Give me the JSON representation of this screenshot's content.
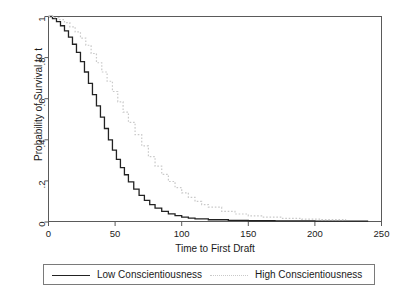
{
  "chart_data": {
    "type": "line",
    "title": "",
    "subtitle": "",
    "xlabel": "Time to First Draft",
    "ylabel": "Probability of Survival to t",
    "xlim": [
      0,
      250
    ],
    "ylim": [
      0,
      1
    ],
    "xticks": [
      "0",
      "50",
      "100",
      "150",
      "200",
      "250"
    ],
    "xtick_values": [
      0,
      50,
      100,
      150,
      200,
      250
    ],
    "yticks": [
      "0",
      ".2",
      ".4",
      ".6",
      ".8",
      "1"
    ],
    "ytick_values": [
      0,
      0.2,
      0.4,
      0.6,
      0.8,
      1
    ],
    "grid": false,
    "legend_position": "below-axes",
    "series": [
      {
        "name": "Low Conscientiousness",
        "style": "solid",
        "color": "#222222",
        "x": [
          0,
          3,
          6,
          9,
          12,
          15,
          18,
          21,
          24,
          27,
          30,
          33,
          36,
          39,
          42,
          45,
          48,
          51,
          54,
          57,
          60,
          64,
          68,
          72,
          76,
          80,
          85,
          90,
          95,
          100,
          105,
          110,
          120,
          135,
          150,
          170,
          200,
          240
        ],
        "y": [
          1.0,
          0.99,
          0.975,
          0.955,
          0.93,
          0.9,
          0.865,
          0.825,
          0.78,
          0.73,
          0.675,
          0.62,
          0.565,
          0.51,
          0.455,
          0.4,
          0.35,
          0.305,
          0.265,
          0.23,
          0.195,
          0.16,
          0.13,
          0.105,
          0.085,
          0.068,
          0.052,
          0.04,
          0.031,
          0.024,
          0.019,
          0.015,
          0.011,
          0.008,
          0.006,
          0.005,
          0.004,
          0.004
        ]
      },
      {
        "name": "High Conscientiousness",
        "style": "dotted",
        "color": "#c9c9c9",
        "x": [
          0,
          4,
          8,
          12,
          16,
          20,
          24,
          28,
          32,
          36,
          40,
          44,
          48,
          52,
          56,
          60,
          65,
          70,
          75,
          80,
          85,
          90,
          95,
          100,
          105,
          110,
          115,
          120,
          130,
          140,
          150,
          160,
          175,
          190,
          205,
          223
        ],
        "y": [
          1.0,
          0.995,
          0.985,
          0.97,
          0.95,
          0.925,
          0.895,
          0.86,
          0.82,
          0.775,
          0.73,
          0.685,
          0.635,
          0.585,
          0.535,
          0.485,
          0.425,
          0.37,
          0.318,
          0.272,
          0.232,
          0.197,
          0.167,
          0.142,
          0.12,
          0.1,
          0.085,
          0.072,
          0.052,
          0.039,
          0.03,
          0.024,
          0.018,
          0.014,
          0.012,
          0.01
        ]
      }
    ]
  },
  "legend": {
    "items": [
      {
        "label": "Low Conscientiousness",
        "style": "solid"
      },
      {
        "label": "High Conscientiousness",
        "style": "dotted"
      }
    ]
  }
}
